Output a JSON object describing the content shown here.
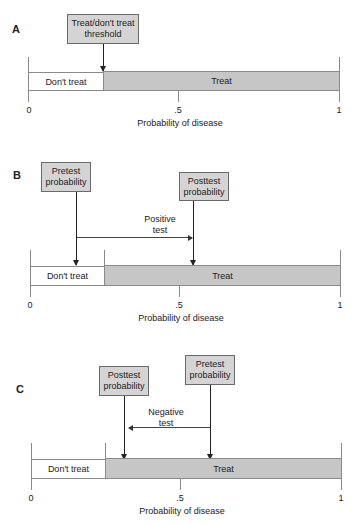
{
  "panels": {
    "A": {
      "label": "A",
      "threshold_box": {
        "line1": "Treat/don't treat",
        "line2": "threshold"
      },
      "bar": {
        "dont_treat": "Don't treat",
        "treat": "Treat"
      },
      "axis": {
        "tick_0": "0",
        "tick_mid": ".5",
        "tick_1": "1",
        "title": "Probability of disease"
      }
    },
    "B": {
      "label": "B",
      "pretest_box": {
        "line1": "Pretest",
        "line2": "probability"
      },
      "posttest_box": {
        "line1": "Posttest",
        "line2": "probability"
      },
      "test": {
        "line1": "Positive",
        "line2": "test"
      },
      "bar": {
        "dont_treat": "Don't treat",
        "treat": "Treat"
      },
      "axis": {
        "tick_0": "0",
        "tick_mid": ".5",
        "tick_1": "1",
        "title": "Probability of disease"
      }
    },
    "C": {
      "label": "C",
      "posttest_box": {
        "line1": "Posttest",
        "line2": "probability"
      },
      "pretest_box": {
        "line1": "Pretest",
        "line2": "probability"
      },
      "test": {
        "line1": "Negative",
        "line2": "test"
      },
      "bar": {
        "dont_treat": "Don't treat",
        "treat": "Treat"
      },
      "axis": {
        "tick_0": "0",
        "tick_mid": ".5",
        "tick_1": "1",
        "title": "Probability of disease"
      }
    }
  },
  "colors": {
    "treat_fill": "#c6c6c6",
    "box_fill": "#d4d4d4",
    "dont_treat_fill": "#ffffff"
  },
  "values": {
    "threshold": 0.24,
    "B": {
      "pretest": 0.15,
      "posttest": 0.53
    },
    "C": {
      "pretest": 0.58,
      "posttest": 0.31
    }
  }
}
